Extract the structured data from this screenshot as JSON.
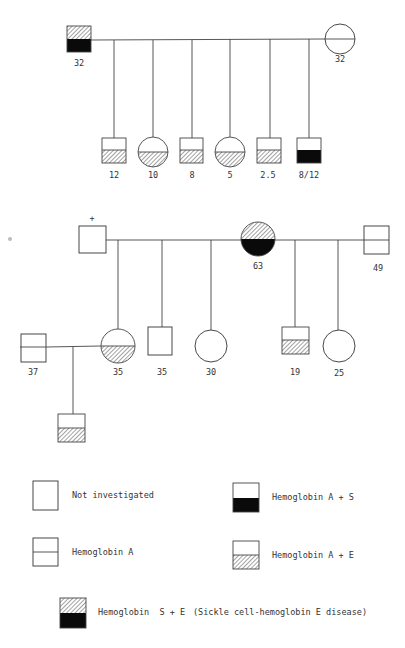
{
  "colors": {
    "line": "#444444",
    "fill_black": "#0a0a0a",
    "hatch": "#555555",
    "background": "#ffffff"
  },
  "generation1": {
    "father": {
      "sex": "male",
      "age": "32",
      "status": "Hemoglobin S + E"
    },
    "mother": {
      "sex": "female",
      "age": "32",
      "status": "Hemoglobin A"
    },
    "children": [
      {
        "sex": "male",
        "age": "12",
        "status": "Hemoglobin A + E"
      },
      {
        "sex": "female",
        "age": "10",
        "status": "Hemoglobin A + E"
      },
      {
        "sex": "male",
        "age": "8",
        "status": "Hemoglobin A + E"
      },
      {
        "sex": "female",
        "age": "5",
        "status": "Hemoglobin A + E"
      },
      {
        "sex": "male",
        "age": "2.5",
        "status": "Hemoglobin A + E"
      },
      {
        "sex": "male",
        "age": "8/12",
        "status": "Hemoglobin A + S"
      }
    ]
  },
  "generation2": {
    "father": {
      "sex": "male",
      "mark": "+",
      "status": "Not investigated"
    },
    "mother": {
      "sex": "female",
      "age": "63",
      "status": "Hemoglobin S + E"
    },
    "second_spouse": {
      "sex": "male",
      "age": "49",
      "status": "Hemoglobin A"
    },
    "children": [
      {
        "sex": "female",
        "age": "35",
        "status": "Hemoglobin A + E"
      },
      {
        "sex": "male",
        "age": "35",
        "status": "Not investigated"
      },
      {
        "sex": "female",
        "age": "30",
        "status": "Not investigated"
      },
      {
        "sex": "male",
        "age": "19",
        "status": "Hemoglobin A + E"
      },
      {
        "sex": "female",
        "age": "25",
        "status": "Not investigated"
      }
    ],
    "in_law": {
      "sex": "male",
      "age": "37",
      "status": "Hemoglobin A"
    },
    "grandchild": {
      "sex": "male",
      "status": "Hemoglobin A + E"
    }
  },
  "legend": [
    {
      "key": "not-investigated",
      "label": "Not investigated"
    },
    {
      "key": "hb-a",
      "label": "Hemoglobin A"
    },
    {
      "key": "hb-as",
      "label": "Hemoglobin A + S"
    },
    {
      "key": "hb-ae",
      "label": "Hemoglobin A + E"
    },
    {
      "key": "hb-se",
      "label": "Hemoglobin  S + E",
      "note": "(Sickle cell-hemoglobin E disease)"
    }
  ]
}
